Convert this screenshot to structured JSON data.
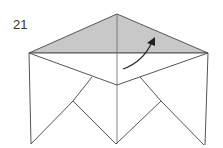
{
  "diagram": {
    "step_number": "21",
    "instruction": "Fold the shaded top flap up along the arrow",
    "colors": {
      "shaded_flap": "#c8c8c8",
      "line": "#555555",
      "paper": "#ffffff",
      "arrow": "#222222"
    }
  }
}
